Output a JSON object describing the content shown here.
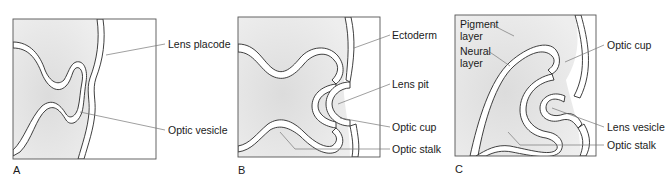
{
  "figure": {
    "type": "diagram",
    "panels": [
      {
        "id": "A",
        "label": "A",
        "annotations": [
          {
            "text": "Lens placode"
          },
          {
            "text": "Optic vesicle"
          }
        ]
      },
      {
        "id": "B",
        "label": "B",
        "annotations": [
          {
            "text": "Ectoderm"
          },
          {
            "text": "Lens pit"
          },
          {
            "text": "Optic cup"
          },
          {
            "text": "Optic stalk"
          }
        ]
      },
      {
        "id": "C",
        "label": "C",
        "annotations": [
          {
            "text": "Pigment"
          },
          {
            "text": "layer"
          },
          {
            "text": "Neural"
          },
          {
            "text": "layer"
          },
          {
            "text": "Optic cup"
          },
          {
            "text": "Lens vesicle"
          },
          {
            "text": "Optic stalk"
          }
        ]
      }
    ],
    "colors": {
      "shading": "#e6e6e6",
      "outline": "#2a2a2a",
      "frame": "#555555",
      "leader": "#777777",
      "text": "#1a1a1a"
    }
  }
}
